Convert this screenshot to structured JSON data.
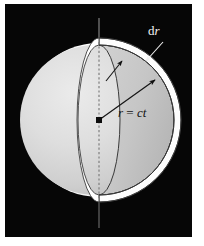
{
  "figure": {
    "background_color": "#060606",
    "page_color": "#ffffff",
    "sphere_fill": "#d8d8d8",
    "shell_fill": "#fdfdfd",
    "cut_fill": "#c9c9c9",
    "outline_color": "#2a2a2a",
    "axis_color": "#8c8c8c"
  },
  "labels": {
    "thickness": {
      "d": "d",
      "r": "r",
      "full": "dr"
    },
    "radius": {
      "r": "r",
      "eq": " = ",
      "ct": "ct",
      "full": "r = ct"
    }
  },
  "geometry": {
    "center": {
      "x": 99,
      "y": 120
    },
    "sphere_radius": 77,
    "shell_thickness": 8,
    "axis_top_y": 18,
    "axis_bottom_y": 228
  },
  "annotations": [
    {
      "name": "thickness-arrow",
      "from": "dr-label",
      "to": "shell-band"
    },
    {
      "name": "inner-thickness-arrow",
      "from": "cut-interior",
      "to": "shell-band"
    },
    {
      "name": "radius-arrow",
      "from": "center-dot",
      "to": "shell-inner-edge"
    }
  ]
}
